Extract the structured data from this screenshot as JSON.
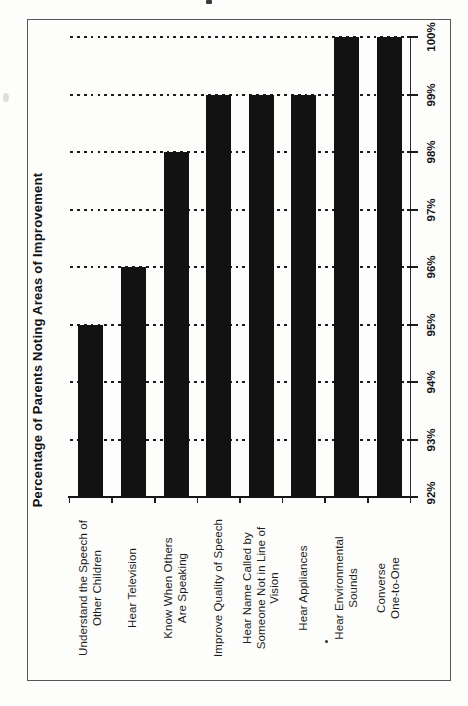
{
  "chart_data": {
    "type": "bar",
    "title": "Percentage of Parents Noting Areas of Improvement",
    "categories": [
      "Understand the Speech of\nOther Children",
      "Hear Television",
      "Know When Others\nAre Speaking",
      "Improve Quality of Speech",
      "Hear Name Called by\nSomeone Not in Line of\nVision",
      "Hear Appliances",
      "Hear Environmental Sounds",
      "Converse One-to-One"
    ],
    "values": [
      95,
      96,
      98,
      99,
      99,
      99,
      100,
      100
    ],
    "value_axis": {
      "min": 92,
      "max": 100,
      "step": 1,
      "tick_labels": [
        "92%",
        "93%",
        "94%",
        "95%",
        "96%",
        "97%",
        "98%",
        "99%",
        "100%"
      ]
    },
    "ylim": [
      92,
      100
    ],
    "grid": "dotted gridlines at each percent",
    "legend": "none",
    "orientation": "landscape chart rotated 90° counterclockwise on portrait page; bars rise from 92% baseline",
    "bar_color": "#121212"
  }
}
